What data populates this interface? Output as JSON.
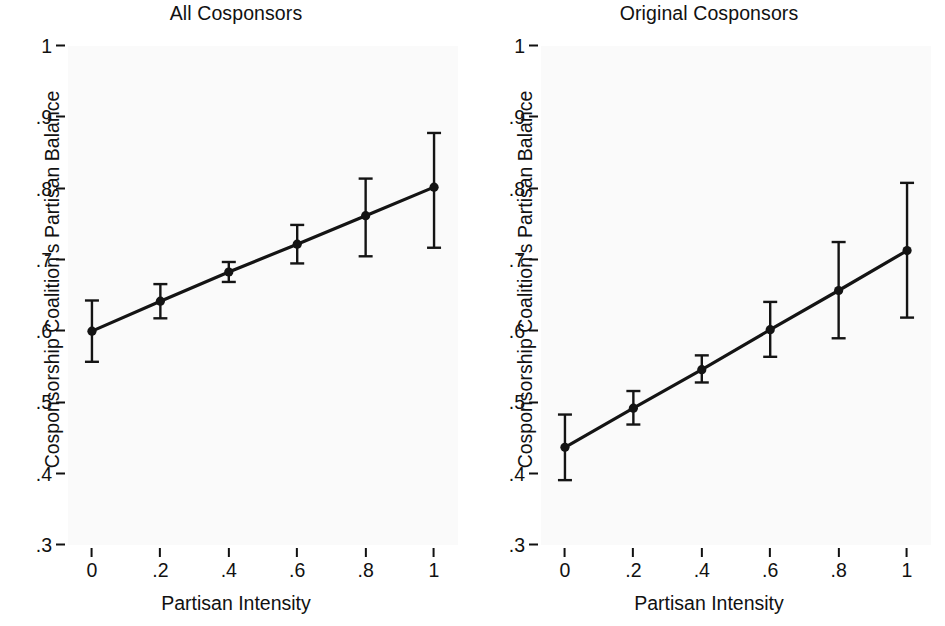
{
  "figure": {
    "axis_label_x": "Partisan Intensity",
    "axis_label_y": "Cosponsorship Coalition's Partisan Balance",
    "line_color": "#141414",
    "background_color": "#fafafa"
  },
  "chart_data": [
    {
      "type": "line",
      "title": "All Cosponsors",
      "xlabel": "Partisan Intensity",
      "ylabel": "Cosponsorship Coalition's Partisan Balance",
      "x": [
        0,
        0.2,
        0.4,
        0.6,
        0.8,
        1
      ],
      "values": [
        0.6,
        0.642,
        0.683,
        0.722,
        0.762,
        0.802
      ],
      "error_low": [
        0.557,
        0.618,
        0.669,
        0.695,
        0.705,
        0.717
      ],
      "error_high": [
        0.643,
        0.666,
        0.697,
        0.749,
        0.814,
        0.878
      ],
      "xlim": [
        -0.07,
        1.07
      ],
      "ylim": [
        0.3,
        1.0
      ],
      "xticks": [
        0,
        0.2,
        0.4,
        0.6,
        0.8,
        1
      ],
      "xticklabels": [
        "0",
        ".2",
        ".4",
        ".6",
        ".8",
        "1"
      ],
      "yticks": [
        0.3,
        0.4,
        0.5,
        0.6,
        0.7,
        0.8,
        0.9,
        1.0
      ],
      "yticklabels": [
        ".3",
        ".4",
        ".5",
        ".6",
        ".7",
        ".8",
        ".9",
        "1"
      ],
      "grid": false,
      "legend": "none",
      "marker": "filled-circle"
    },
    {
      "type": "line",
      "title": "Original Cosponsors",
      "xlabel": "Partisan Intensity",
      "ylabel": "Cosponsorship Coalition's Partisan Balance",
      "x": [
        0,
        0.2,
        0.4,
        0.6,
        0.8,
        1
      ],
      "values": [
        0.437,
        0.492,
        0.546,
        0.602,
        0.657,
        0.713
      ],
      "error_low": [
        0.391,
        0.469,
        0.528,
        0.564,
        0.59,
        0.619
      ],
      "error_high": [
        0.483,
        0.516,
        0.566,
        0.641,
        0.725,
        0.808
      ],
      "xlim": [
        -0.07,
        1.07
      ],
      "ylim": [
        0.3,
        1.0
      ],
      "xticks": [
        0,
        0.2,
        0.4,
        0.6,
        0.8,
        1
      ],
      "xticklabels": [
        "0",
        ".2",
        ".4",
        ".6",
        ".8",
        "1"
      ],
      "yticks": [
        0.3,
        0.4,
        0.5,
        0.6,
        0.7,
        0.8,
        0.9,
        1.0
      ],
      "yticklabels": [
        ".3",
        ".4",
        ".5",
        ".6",
        ".7",
        ".8",
        ".9",
        "1"
      ],
      "grid": false,
      "legend": "none",
      "marker": "filled-circle"
    }
  ]
}
